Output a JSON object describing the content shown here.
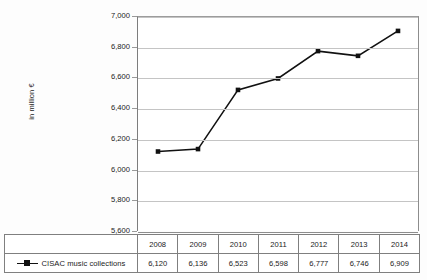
{
  "chart_data": {
    "type": "line",
    "title": "",
    "subtitle": "",
    "xlabel": "",
    "ylabel": "in million €",
    "categories": [
      "2008",
      "2009",
      "2010",
      "2011",
      "2012",
      "2013",
      "2014"
    ],
    "series": [
      {
        "name": "CISAC music collections",
        "values": [
          6120,
          6136,
          6523,
          6598,
          6777,
          6746,
          6909
        ],
        "value_labels": [
          "6,120",
          "6,136",
          "6,523",
          "6,598",
          "6,777",
          "6,746",
          "6,909"
        ],
        "color": "#111111",
        "marker": "square"
      }
    ],
    "ylim": [
      5600,
      7000
    ],
    "ytick_step": 200,
    "ytick_labels": [
      "7,000",
      "6,800",
      "6,600",
      "6,400",
      "6,200",
      "6,000",
      "5,800",
      "5,600"
    ],
    "ytick_values": [
      7000,
      6800,
      6600,
      6400,
      6200,
      6000,
      5800,
      5600
    ],
    "grid": true,
    "grid_axis": "y",
    "legend_position": "bottom-table",
    "has_data_table": true
  },
  "table": {
    "row_header_label": "CISAC music collections",
    "header_row": [
      "2008",
      "2009",
      "2010",
      "2011",
      "2012",
      "2013",
      "2014"
    ],
    "value_row": [
      "6,120",
      "6,136",
      "6,523",
      "6,598",
      "6,777",
      "6,746",
      "6,909"
    ]
  },
  "axis": {
    "y_title": "in million €"
  }
}
